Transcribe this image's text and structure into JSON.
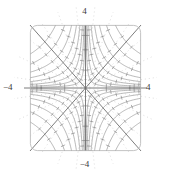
{
  "figure": {
    "title": "",
    "kind": "phase-portrait",
    "background": "#ffffff",
    "frame": {
      "x": 30,
      "y": 25,
      "width": 111,
      "height": 126,
      "corner_radius": 7,
      "stroke": "#b4b4b4",
      "stroke_width": 0.8
    }
  },
  "labels": {
    "top": "4",
    "bottom": "−4",
    "left": "−4",
    "right": "4",
    "color": "#3c3c3c",
    "font_size_px": 9
  },
  "chart_data": {
    "type": "line",
    "title": "",
    "xlabel": "",
    "ylabel": "",
    "xlim": [
      -4,
      4
    ],
    "ylim": [
      -4,
      4
    ],
    "xticks": [
      -4,
      4
    ],
    "yticks": [
      -4,
      4
    ],
    "xticklabels": [
      "−4",
      "4"
    ],
    "yticklabels": [
      "−4",
      "4"
    ],
    "grid": false,
    "legend": null,
    "equilibrium": {
      "x": 0,
      "y": 0,
      "classification": "saddle"
    },
    "system": {
      "xdot": "x",
      "ydot": "-y"
    },
    "separatrices": [
      {
        "name": "horizontal-axis",
        "from": [
          -4,
          0
        ],
        "to": [
          4,
          0
        ],
        "direction": "outward"
      },
      {
        "name": "vertical-axis",
        "from": [
          0,
          4
        ],
        "to": [
          0,
          -4
        ],
        "direction": "inward"
      },
      {
        "name": "diagonal-up",
        "from": [
          -4,
          -4
        ],
        "to": [
          4,
          4
        ],
        "direction": "mixed"
      },
      {
        "name": "diagonal-down",
        "from": [
          -4,
          4
        ],
        "to": [
          4,
          -4
        ],
        "direction": "mixed"
      }
    ],
    "trajectories": {
      "family": "hyperbolas",
      "relation": "x*y = c",
      "c_values": [
        0.18,
        0.45,
        0.9,
        1.6,
        2.6,
        4.0,
        6.0,
        8.6
      ],
      "quadrant_mirroring": true,
      "stroke": "#8c8c8c",
      "stroke_width": 0.6
    },
    "direction_markers": {
      "style": "tick-arrow",
      "count_per_curve": 6,
      "stroke": "#787878",
      "length_px": 4
    },
    "dotted_rays": {
      "stroke": "#b9b9b9",
      "dash": "1 3"
    }
  }
}
